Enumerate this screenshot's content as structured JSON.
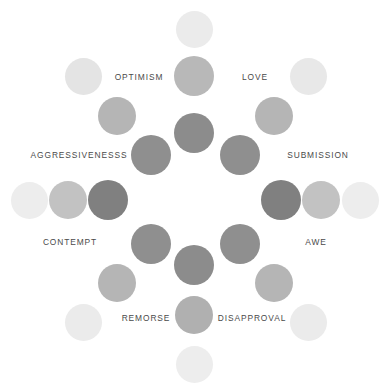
{
  "diagram": {
    "type": "emotion-wheel",
    "background_color": "#ffffff",
    "label_color": "#4a4a4a",
    "canvas": {
      "width": 392,
      "height": 389
    },
    "center": {
      "x": 194,
      "y": 133
    }
  },
  "labels": [
    {
      "id": "optimism",
      "text": "OPTIMISM",
      "x": 139,
      "y": 77
    },
    {
      "id": "love",
      "text": "LOVE",
      "x": 255,
      "y": 77
    },
    {
      "id": "aggressivenesss",
      "text": "AGGRESSIVENESSS",
      "x": 79,
      "y": 155
    },
    {
      "id": "submission",
      "text": "SUBMISSION",
      "x": 318,
      "y": 155
    },
    {
      "id": "contempt",
      "text": "CONTEMPT",
      "x": 70,
      "y": 242
    },
    {
      "id": "awe",
      "text": "AWE",
      "x": 316,
      "y": 242
    },
    {
      "id": "remorse",
      "text": "REMORSE",
      "x": 146,
      "y": 318
    },
    {
      "id": "disapproval",
      "text": "DISAPPROVAL",
      "x": 252,
      "y": 318
    }
  ],
  "dots": [
    {
      "id": "center-core",
      "x": 194,
      "y": 133,
      "d": 40,
      "color": "#8c8c8c"
    },
    {
      "id": "n-1",
      "x": 194,
      "y": 76,
      "d": 40,
      "color": "#b8b8b8"
    },
    {
      "id": "n-2",
      "x": 194,
      "y": 29,
      "d": 37,
      "color": "#ebebeb"
    },
    {
      "id": "nw-1",
      "x": 151,
      "y": 155,
      "d": 40,
      "color": "#8f8f8f"
    },
    {
      "id": "nw-2",
      "x": 117,
      "y": 116,
      "d": 38,
      "color": "#b5b5b5"
    },
    {
      "id": "nw-3",
      "x": 83,
      "y": 76,
      "d": 37,
      "color": "#e4e4e4"
    },
    {
      "id": "ne-1",
      "x": 240,
      "y": 155,
      "d": 40,
      "color": "#8f8f8f"
    },
    {
      "id": "ne-2",
      "x": 274,
      "y": 116,
      "d": 38,
      "color": "#b5b5b5"
    },
    {
      "id": "ne-3",
      "x": 308,
      "y": 76,
      "d": 37,
      "color": "#e8e8e8"
    },
    {
      "id": "w-1",
      "x": 108,
      "y": 200,
      "d": 40,
      "color": "#808080"
    },
    {
      "id": "w-2",
      "x": 68,
      "y": 200,
      "d": 38,
      "color": "#c2c2c2"
    },
    {
      "id": "w-3",
      "x": 29,
      "y": 200,
      "d": 37,
      "color": "#ededed"
    },
    {
      "id": "e-1",
      "x": 281,
      "y": 200,
      "d": 40,
      "color": "#808080"
    },
    {
      "id": "e-2",
      "x": 321,
      "y": 200,
      "d": 38,
      "color": "#c2c2c2"
    },
    {
      "id": "e-3",
      "x": 360,
      "y": 200,
      "d": 37,
      "color": "#ededed"
    },
    {
      "id": "sw-1",
      "x": 151,
      "y": 244,
      "d": 40,
      "color": "#8f8f8f"
    },
    {
      "id": "sw-2",
      "x": 117,
      "y": 283,
      "d": 38,
      "color": "#b5b5b5"
    },
    {
      "id": "sw-3",
      "x": 83,
      "y": 322,
      "d": 37,
      "color": "#ebebeb"
    },
    {
      "id": "se-1",
      "x": 240,
      "y": 244,
      "d": 40,
      "color": "#8f8f8f"
    },
    {
      "id": "se-2",
      "x": 274,
      "y": 283,
      "d": 38,
      "color": "#b5b5b5"
    },
    {
      "id": "se-3",
      "x": 308,
      "y": 322,
      "d": 37,
      "color": "#ebebeb"
    },
    {
      "id": "s-1",
      "x": 194,
      "y": 265,
      "d": 40,
      "color": "#8c8c8c"
    },
    {
      "id": "s-2",
      "x": 194,
      "y": 315,
      "d": 38,
      "color": "#b0b0b0"
    },
    {
      "id": "s-3",
      "x": 194,
      "y": 364,
      "d": 37,
      "color": "#ededed"
    }
  ]
}
